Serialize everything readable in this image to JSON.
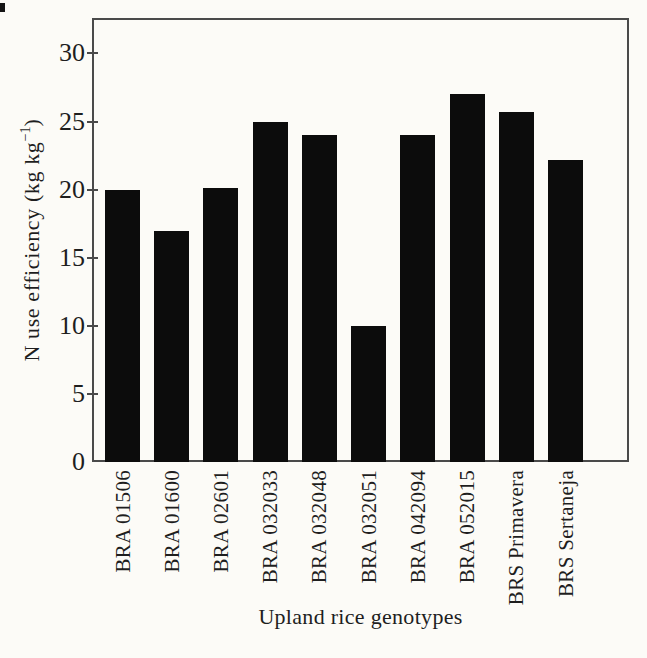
{
  "chart_data": {
    "type": "bar",
    "categories": [
      "BRA 01506",
      "BRA 01600",
      "BRA 02601",
      "BRA 032033",
      "BRA 032048",
      "BRA 032051",
      "BRA 042094",
      "BRA 052015",
      "BRS Primavera",
      "BRS Sertaneja"
    ],
    "values": [
      20,
      17,
      20.1,
      25,
      24,
      10,
      24,
      27,
      25.7,
      22.2
    ],
    "title": "",
    "xlabel": "Upland rice genotypes",
    "ylabel": "N use efficiency (kg kg−1)",
    "ylabel_parts": {
      "prefix": "N use efficiency (kg kg",
      "superscript": "−1",
      "suffix": ")"
    },
    "yticks": [
      0,
      5,
      10,
      15,
      20,
      25,
      30
    ],
    "ylim": [
      0,
      32.6
    ],
    "grid": false,
    "legend": false,
    "bar_color": "#0c0c0c",
    "frame_color": "#4a4a4a",
    "text_color": "#1e1e1e",
    "background": "#fcfbf7",
    "artifact_color": "#141414"
  }
}
